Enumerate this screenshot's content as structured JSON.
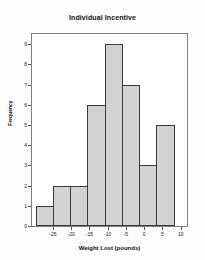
{
  "chart_data": {
    "type": "bar",
    "title": "Individual Incentive",
    "xlabel": "Weight Lost (pounds)",
    "ylabel": "Frequency",
    "categories": [
      "-27.5",
      "-22.5",
      "-17.5",
      "-12.5",
      "-7.5",
      "-2.5",
      "2.5",
      "7.5"
    ],
    "values": [
      1,
      2,
      2,
      6,
      9,
      7,
      3,
      5
    ],
    "bin_edges": [
      -30,
      -25,
      -20,
      -15,
      -10,
      -5,
      0,
      5,
      10
    ],
    "xtick_labels": [
      "-25",
      "-20",
      "-15",
      "-10",
      "-5",
      "0",
      "5",
      "10"
    ],
    "xtick_values": [
      -25,
      -20,
      -15,
      -10,
      -5,
      0,
      5,
      10
    ],
    "ytick_labels": [
      "0",
      "1",
      "2",
      "3",
      "4",
      "5",
      "6",
      "7",
      "8",
      "9"
    ],
    "ylim": [
      0,
      9.6
    ],
    "xlim": [
      -31,
      12
    ],
    "grid": false,
    "legend": false,
    "bar_fill_color": "#d2d2d2",
    "bar_edge_color": "#3a3a3c",
    "frame_color": "#7d7f86"
  }
}
